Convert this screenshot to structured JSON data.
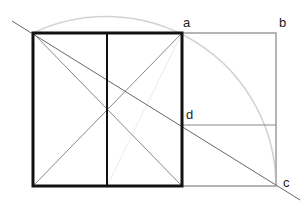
{
  "diagram": {
    "labels": {
      "a": "a",
      "b": "b",
      "c": "c",
      "d": "d"
    },
    "colors": {
      "bold": "#111111",
      "thin": "#888888",
      "light": "#bdbdbd",
      "arc": "#d0d0d0"
    }
  }
}
